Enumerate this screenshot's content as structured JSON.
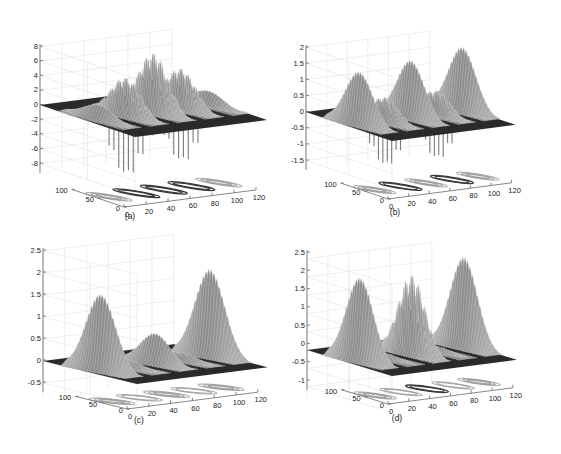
{
  "figure": {
    "background": "#ffffff",
    "surface_color": "#9a9a9a",
    "plane_color": "#2a2a2a",
    "grid_color": "#e2e2e2",
    "axis_color": "#555555"
  },
  "chart_data": [
    {
      "id": "a",
      "type": "surface3d",
      "caption": "(a)",
      "title": "",
      "xlabel": "",
      "ylabel": "",
      "zlabel": "",
      "xlim": [
        0,
        120
      ],
      "ylim": [
        0,
        100
      ],
      "zlim": [
        -10,
        8
      ],
      "xticks": [
        0,
        20,
        40,
        60,
        80,
        100,
        120
      ],
      "xtick_labels": [
        "0",
        "20",
        "40",
        "60",
        "80",
        "100",
        "120"
      ],
      "yticks": [
        0,
        50,
        100
      ],
      "ytick_labels": [
        "0",
        "50",
        "100"
      ],
      "zticks": [
        8,
        6,
        4,
        2,
        0,
        -2,
        -4,
        -6,
        -8
      ],
      "ztick_labels": [
        "8",
        "6",
        "4",
        "2",
        "0",
        "-2",
        "-4",
        "-6",
        "-8"
      ],
      "grid": true,
      "floor_contours": true,
      "peaks": [
        {
          "x": 10,
          "y": 50,
          "height": 2.0,
          "kind": "smooth"
        },
        {
          "x": 35,
          "y": 50,
          "height": 5.5,
          "depth": -9.0,
          "kind": "oscillating"
        },
        {
          "x": 60,
          "y": 50,
          "height": 8.5,
          "depth": -3.0,
          "kind": "oscillating"
        },
        {
          "x": 85,
          "y": 50,
          "height": 5.8,
          "depth": -8.0,
          "kind": "oscillating"
        },
        {
          "x": 110,
          "y": 50,
          "height": 2.0,
          "kind": "smooth"
        }
      ]
    },
    {
      "id": "b",
      "type": "surface3d",
      "caption": "(b)",
      "title": "",
      "xlabel": "",
      "ylabel": "",
      "zlabel": "",
      "xlim": [
        0,
        120
      ],
      "ylim": [
        0,
        100
      ],
      "zlim": [
        -2,
        2
      ],
      "xticks": [
        0,
        20,
        40,
        60,
        80,
        100,
        120
      ],
      "xtick_labels": [
        "0",
        "20",
        "40",
        "60",
        "80",
        "100",
        "120"
      ],
      "yticks": [
        0,
        50,
        100
      ],
      "ytick_labels": [
        "0",
        "50",
        "100"
      ],
      "zticks": [
        2,
        1.5,
        1,
        0.5,
        0,
        -0.5,
        -1,
        -1.5
      ],
      "ztick_labels": [
        "2",
        "1.5",
        "1",
        "0.5",
        "0",
        "-0.5",
        "-1",
        "-1.5"
      ],
      "grid": true,
      "floor_contours": true,
      "peaks": [
        {
          "x": 10,
          "y": 50,
          "height": 1.65,
          "kind": "smooth"
        },
        {
          "x": 35,
          "y": 50,
          "height": 0.8,
          "depth": -1.5,
          "kind": "oscillating"
        },
        {
          "x": 60,
          "y": 50,
          "height": 1.8,
          "kind": "smooth"
        },
        {
          "x": 85,
          "y": 50,
          "height": 0.8,
          "depth": -1.5,
          "kind": "oscillating"
        },
        {
          "x": 110,
          "y": 50,
          "height": 2.0,
          "kind": "smooth"
        }
      ]
    },
    {
      "id": "c",
      "type": "surface3d",
      "caption": "(c)",
      "title": "",
      "xlabel": "",
      "ylabel": "",
      "zlabel": "",
      "xlim": [
        0,
        120
      ],
      "ylim": [
        0,
        100
      ],
      "zlim": [
        -0.5,
        2.5
      ],
      "xticks": [
        0,
        20,
        40,
        60,
        80,
        100,
        120
      ],
      "xtick_labels": [
        "0",
        "20",
        "40",
        "60",
        "80",
        "100",
        "120"
      ],
      "yticks": [
        0,
        50,
        100
      ],
      "ytick_labels": [
        "0",
        "50",
        "100"
      ],
      "zticks": [
        2.5,
        2,
        1.5,
        1,
        0.5,
        0,
        -0.5
      ],
      "ztick_labels": [
        "2.5",
        "2",
        "1.5",
        "1",
        "0.5",
        "0",
        "-0.5"
      ],
      "grid": true,
      "floor_contours": true,
      "peaks": [
        {
          "x": 10,
          "y": 50,
          "height": 1.75,
          "kind": "smooth"
        },
        {
          "x": 35,
          "y": 50,
          "height": 0.2,
          "kind": "oscillating"
        },
        {
          "x": 60,
          "y": 50,
          "height": 0.7,
          "kind": "smooth"
        },
        {
          "x": 85,
          "y": 50,
          "height": 0.2,
          "kind": "oscillating"
        },
        {
          "x": 110,
          "y": 50,
          "height": 2.0,
          "kind": "smooth"
        }
      ]
    },
    {
      "id": "d",
      "type": "surface3d",
      "caption": "(d)",
      "title": "",
      "xlabel": "",
      "ylabel": "",
      "zlabel": "",
      "xlim": [
        0,
        120
      ],
      "ylim": [
        0,
        100
      ],
      "zlim": [
        -1,
        2.5
      ],
      "xticks": [
        0,
        20,
        40,
        60,
        80,
        100,
        120
      ],
      "xtick_labels": [
        "0",
        "20",
        "40",
        "60",
        "80",
        "100",
        "120"
      ],
      "yticks": [
        0,
        50,
        100
      ],
      "ytick_labels": [
        "0",
        "50",
        "100"
      ],
      "zticks": [
        2.5,
        2,
        1.5,
        1,
        0.5,
        0,
        -0.5,
        -1
      ],
      "ztick_labels": [
        "2.5",
        "2",
        "1.5",
        "1",
        "0.5",
        "0",
        "-0.5",
        "-1"
      ],
      "grid": true,
      "floor_contours": true,
      "peaks": [
        {
          "x": 10,
          "y": 50,
          "height": 2.3,
          "kind": "smooth"
        },
        {
          "x": 35,
          "y": 50,
          "height": 0.15,
          "kind": "oscillating"
        },
        {
          "x": 60,
          "y": 50,
          "height": 2.3,
          "kind": "oscillating"
        },
        {
          "x": 85,
          "y": 50,
          "height": 0.15,
          "kind": "oscillating"
        },
        {
          "x": 110,
          "y": 50,
          "height": 2.5,
          "kind": "smooth"
        }
      ]
    }
  ]
}
